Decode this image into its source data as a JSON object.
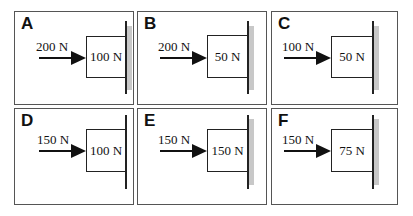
{
  "diagram": {
    "panels": [
      {
        "letter": "A",
        "applied_force": "200 N",
        "block_weight": "100 N"
      },
      {
        "letter": "B",
        "applied_force": "200 N",
        "block_weight": "50 N"
      },
      {
        "letter": "C",
        "applied_force": "100 N",
        "block_weight": "50 N"
      },
      {
        "letter": "D",
        "applied_force": "150 N",
        "block_weight": "100 N"
      },
      {
        "letter": "E",
        "applied_force": "150 N",
        "block_weight": "150 N"
      },
      {
        "letter": "F",
        "applied_force": "150 N",
        "block_weight": "75 N"
      }
    ],
    "colors": {
      "border": "#555555",
      "ink": "#111111",
      "wall_shade": "#c8c8c8",
      "background": "#ffffff"
    }
  }
}
